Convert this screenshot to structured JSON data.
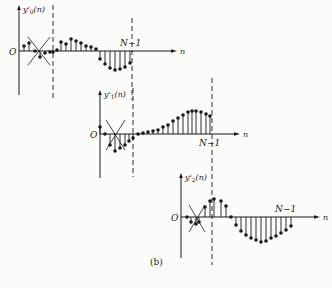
{
  "figure": {
    "caption": "(b)",
    "ink_color": "#1a1a1a",
    "background": "#fbfbf9"
  },
  "panels": [
    {
      "id": "y0",
      "ylabel": "y'₀(n)",
      "ylabel_main": "y'",
      "ylabel_sub": "0",
      "ylabel_arg": "(n)",
      "origin_label": "O",
      "xlabel": "n",
      "end_label": "N−1",
      "origin": [
        19,
        51
      ],
      "y_axis": [
        5,
        95
      ],
      "x_axis_end": 177,
      "dashed_lines": [
        {
          "x": 53,
          "y1": 5,
          "y2": 100
        },
        {
          "x": 132,
          "y1": 18,
          "y2": 100
        }
      ],
      "cross": {
        "x1": 28,
        "x2": 50,
        "y1": 37,
        "y2": 65
      },
      "end_label_pos": [
        120,
        46
      ],
      "ylabel_pos": [
        23,
        12
      ],
      "stems": [
        [
          24,
          46
        ],
        [
          29,
          43
        ],
        [
          35,
          51
        ],
        [
          40,
          57
        ],
        [
          45,
          53
        ],
        [
          50,
          52
        ],
        [
          53,
          52
        ],
        [
          57,
          50
        ],
        [
          61,
          42
        ],
        [
          66,
          44
        ],
        [
          71,
          39
        ],
        [
          76,
          41
        ],
        [
          81,
          43
        ],
        [
          86,
          46
        ],
        [
          91,
          47
        ],
        [
          96,
          49
        ],
        [
          100,
          59
        ],
        [
          105,
          64
        ],
        [
          110,
          68
        ],
        [
          115,
          70
        ],
        [
          120,
          69
        ],
        [
          125,
          67
        ],
        [
          130,
          63
        ]
      ]
    },
    {
      "id": "y1",
      "ylabel": "y'₁(n)",
      "ylabel_main": "y'",
      "ylabel_sub": "1",
      "ylabel_arg": "(n)",
      "origin_label": "O",
      "xlabel": "n",
      "end_label": "N−1",
      "origin": [
        100,
        134
      ],
      "y_axis": [
        90,
        178
      ],
      "x_axis_end": 240,
      "dashed_lines": [
        {
          "x": 133,
          "y1": 88,
          "y2": 177
        },
        {
          "x": 212,
          "y1": 78,
          "y2": 265
        }
      ],
      "cross": {
        "x1": 106,
        "x2": 125,
        "y1": 120,
        "y2": 150
      },
      "end_label_pos": [
        199,
        146
      ],
      "ylabel_pos": [
        104,
        97
      ],
      "stems": [
        [
          100,
          127
        ],
        [
          105,
          134
        ],
        [
          110,
          145
        ],
        [
          115,
          151
        ],
        [
          120,
          148
        ],
        [
          125,
          145
        ],
        [
          129,
          141
        ],
        [
          133,
          138
        ],
        [
          138,
          134
        ],
        [
          143,
          133
        ],
        [
          148,
          132
        ],
        [
          153,
          131
        ],
        [
          158,
          130
        ],
        [
          163,
          127
        ],
        [
          168,
          125
        ],
        [
          173,
          121
        ],
        [
          178,
          118
        ],
        [
          183,
          115
        ],
        [
          188,
          112
        ],
        [
          192,
          111
        ],
        [
          196,
          111
        ],
        [
          201,
          112
        ],
        [
          206,
          114
        ],
        [
          210,
          116
        ]
      ]
    },
    {
      "id": "y2",
      "ylabel": "y'₂(n)",
      "ylabel_main": "y'",
      "ylabel_sub": "2",
      "ylabel_arg": "(n)",
      "origin_label": "O",
      "xlabel": "n",
      "end_label": "N−1",
      "origin": [
        181,
        217
      ],
      "y_axis": [
        173,
        258
      ],
      "x_axis_end": 320,
      "dashed_lines": [],
      "cross": {
        "x1": 189,
        "x2": 205,
        "y1": 205,
        "y2": 232
      },
      "end_label_pos": [
        275,
        212
      ],
      "ylabel_pos": [
        185,
        180
      ],
      "stems": [
        [
          187,
          217
        ],
        [
          191,
          222
        ],
        [
          196,
          224
        ],
        [
          199,
          222
        ],
        [
          205,
          207
        ],
        [
          210,
          201
        ],
        [
          214,
          199
        ],
        [
          221,
          201
        ],
        [
          226,
          206
        ],
        [
          231,
          217
        ],
        [
          236,
          225
        ],
        [
          241,
          231
        ],
        [
          246,
          235
        ],
        [
          251,
          238
        ],
        [
          256,
          240
        ],
        [
          261,
          242
        ],
        [
          266,
          241
        ],
        [
          271,
          238
        ],
        [
          276,
          236
        ],
        [
          281,
          233
        ],
        [
          286,
          230
        ],
        [
          291,
          226
        ]
      ]
    }
  ]
}
